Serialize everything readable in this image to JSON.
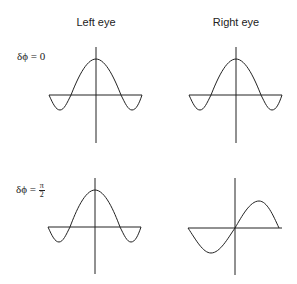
{
  "columns": [
    {
      "label": "Left eye"
    },
    {
      "label": "Right eye"
    }
  ],
  "rows": [
    {
      "label_prefix": "δϕ = ",
      "label_value": "0"
    },
    {
      "label_prefix": "δϕ = ",
      "label_num": "π",
      "label_den": "2"
    }
  ],
  "panels": [
    {
      "row": 0,
      "col": "Left eye",
      "waveform": "cosine",
      "description": "cosine peak at origin"
    },
    {
      "row": 0,
      "col": "Right eye",
      "waveform": "cosine",
      "description": "cosine peak at origin"
    },
    {
      "row": 1,
      "col": "Left eye",
      "waveform": "cosine",
      "description": "cosine peak at origin"
    },
    {
      "row": 1,
      "col": "Right eye",
      "waveform": "sine",
      "description": "sine shifted by pi/2"
    }
  ],
  "colors": {
    "stroke": "#222222",
    "background": "#ffffff"
  }
}
